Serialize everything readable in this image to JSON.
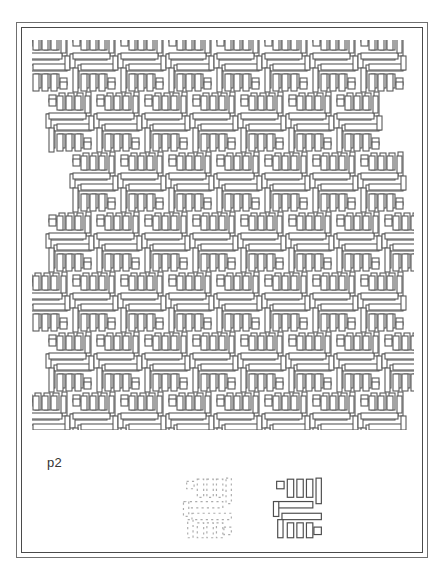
{
  "page": {
    "background_color": "#ffffff",
    "width": 444,
    "height": 584
  },
  "frame": {
    "style": "double-rule-rectangle",
    "outer_color": "#6f6f6f",
    "inner_color": "#4a4a4a"
  },
  "plate": {
    "label": "p2",
    "label_color": "#333333"
  },
  "pattern": {
    "name": "p2 wallpaper pattern",
    "symmetry_group": "p2",
    "description": "Interlocking maze / meander motif repeated on an offset lattice with 2-fold rotation centres.",
    "stroke_color": "#5a5a5a",
    "fill_color": "#ffffff",
    "tile_width": 48,
    "tile_height": 60,
    "columns": 9,
    "rows": 8,
    "row_offset": 24,
    "edge_style": "ragged"
  },
  "motifs": [
    {
      "name": "motif-faded",
      "label": "",
      "opacity": 0.55,
      "note": "lightly printed duplicate of the fundamental motif"
    },
    {
      "name": "motif-solid",
      "label": "",
      "opacity": 1.0,
      "note": "fundamental motif of the p2 pattern"
    }
  ]
}
